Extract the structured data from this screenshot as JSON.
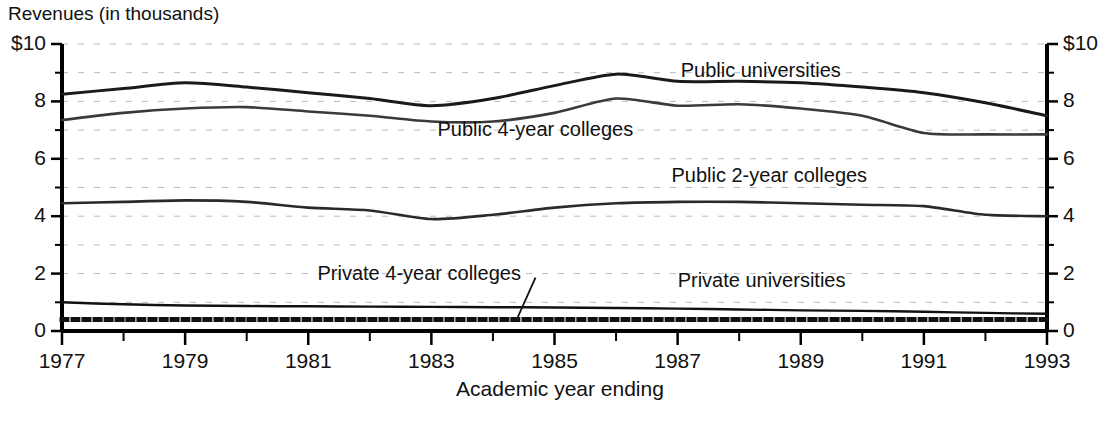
{
  "chart_data": {
    "type": "line",
    "title": "Revenues (in thousands)",
    "xlabel": "Academic year ending",
    "ylabel": "",
    "xlim": [
      1977,
      1993
    ],
    "ylim": [
      0,
      10
    ],
    "grid": true,
    "grid_style": "dashed horizontal minor",
    "legend_position": "inline-labels",
    "y_ticks": [
      "$10",
      "8",
      "6",
      "4",
      "2",
      "0"
    ],
    "y_tick_values": [
      10,
      8,
      6,
      4,
      2,
      0
    ],
    "y_minor_ticks": [
      1,
      3,
      5,
      7,
      9
    ],
    "y_axis_right_ticks": [
      "$10",
      "8",
      "6",
      "4",
      "2",
      "0"
    ],
    "x_ticks_all": [
      1977,
      1978,
      1979,
      1980,
      1981,
      1982,
      1983,
      1984,
      1985,
      1986,
      1987,
      1988,
      1989,
      1990,
      1991,
      1992,
      1993
    ],
    "x_tick_labels": [
      "1977",
      "1979",
      "1981",
      "1983",
      "1985",
      "1987",
      "1989",
      "1991",
      "1993"
    ],
    "x_tick_label_values": [
      1977,
      1979,
      1981,
      1983,
      1985,
      1987,
      1989,
      1991,
      1993
    ],
    "x": [
      1977,
      1978,
      1979,
      1980,
      1981,
      1982,
      1983,
      1984,
      1985,
      1986,
      1987,
      1988,
      1989,
      1990,
      1991,
      1992,
      1993
    ],
    "series": [
      {
        "name": "Public universities",
        "style": "solid",
        "color": "#1a1a1a",
        "width": 3.0,
        "values": [
          8.25,
          8.45,
          8.65,
          8.5,
          8.3,
          8.1,
          7.85,
          8.1,
          8.55,
          8.95,
          8.7,
          8.7,
          8.65,
          8.5,
          8.3,
          7.95,
          7.5
        ]
      },
      {
        "name": "Public 4-year colleges",
        "style": "solid",
        "color": "#3a3a3a",
        "width": 2.6,
        "values": [
          7.35,
          7.6,
          7.75,
          7.8,
          7.65,
          7.5,
          7.3,
          7.3,
          7.6,
          8.1,
          7.85,
          7.9,
          7.75,
          7.5,
          6.9,
          6.85,
          6.85
        ]
      },
      {
        "name": "Public 2-year colleges",
        "style": "solid",
        "color": "#2a2a2a",
        "width": 2.6,
        "values": [
          4.45,
          4.5,
          4.55,
          4.5,
          4.3,
          4.2,
          3.9,
          4.05,
          4.3,
          4.45,
          4.5,
          4.5,
          4.45,
          4.4,
          4.35,
          4.05,
          4.0
        ]
      },
      {
        "name": "Private universities",
        "style": "solid",
        "color": "#111111",
        "width": 2.4,
        "values": [
          1.0,
          0.93,
          0.89,
          0.87,
          0.86,
          0.85,
          0.84,
          0.83,
          0.82,
          0.8,
          0.78,
          0.75,
          0.72,
          0.7,
          0.67,
          0.63,
          0.6
        ]
      },
      {
        "name": "Private 4-year colleges",
        "style": "dotted",
        "color": "#111111",
        "width": 5.0,
        "values": [
          0.4,
          0.4,
          0.4,
          0.4,
          0.4,
          0.4,
          0.4,
          0.4,
          0.4,
          0.4,
          0.4,
          0.4,
          0.4,
          0.4,
          0.4,
          0.4,
          0.4
        ]
      }
    ],
    "annotations": [
      {
        "text": "Public universities",
        "x": 1987.05,
        "y": 9.05,
        "anchor": "start",
        "leader": false
      },
      {
        "text": "Public 4-year colleges",
        "x": 1983.1,
        "y": 7.0,
        "anchor": "start",
        "leader": false
      },
      {
        "text": "Public 2-year colleges",
        "x": 1986.9,
        "y": 5.4,
        "anchor": "start",
        "leader": false
      },
      {
        "text": "Private 4-year colleges",
        "x": 1981.15,
        "y": 2.0,
        "anchor": "start",
        "leader": true
      },
      {
        "text": "Private universities",
        "x": 1987.0,
        "y": 1.75,
        "anchor": "start",
        "leader": false
      }
    ]
  }
}
